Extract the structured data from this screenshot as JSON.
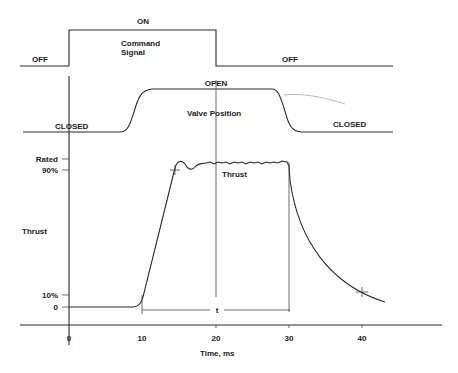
{
  "diagram": {
    "type": "timing-diagram",
    "command_signal": {
      "title_line1": "Command",
      "title_line2": "Signal",
      "high_label": "ON",
      "low_label_left": "OFF",
      "low_label_right": "OFF",
      "on_time_ms": 0,
      "off_time_ms": 20
    },
    "valve_position": {
      "title": "Valve Position",
      "open_label": "OPEN",
      "closed_label_left": "CLOSED",
      "closed_label_right": "CLOSED",
      "opening_start_ms": 7.3,
      "opening_end_ms": 11.5,
      "closing_start_ms": 28.5,
      "closing_end_ms": 31.5
    },
    "thrust": {
      "title": "Thrust",
      "axis_label": "Thrust",
      "y_ticks": [
        "Rated",
        "90%",
        "10%",
        "0"
      ],
      "rise_start_ms": 10,
      "reach_90_ms": 14.5,
      "shutdown_ms": 30,
      "decay_10_ms": 40,
      "interval_label": "t"
    },
    "time_axis": {
      "label": "Time, ms",
      "ticks": [
        "0",
        "10",
        "20",
        "30",
        "40"
      ],
      "range_ms": [
        -7,
        51
      ]
    }
  }
}
